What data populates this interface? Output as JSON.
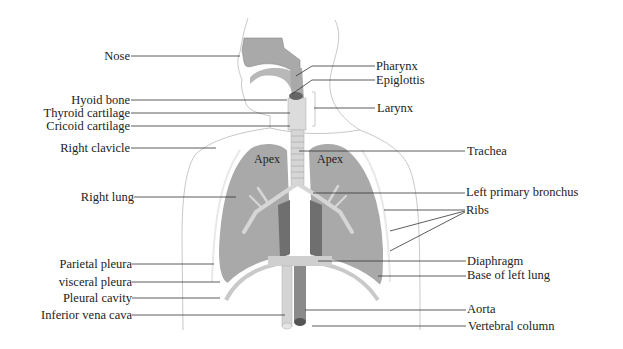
{
  "left_labels": [
    {
      "id": "nose",
      "text": "Nose",
      "y": 56
    },
    {
      "id": "hyoid-bone",
      "text": "Hyoid bone",
      "y": 100
    },
    {
      "id": "thyroid-cartilage",
      "text": "Thyroid cartilage",
      "y": 113
    },
    {
      "id": "cricoid-cartilage",
      "text": "Cricoid cartilage",
      "y": 126
    },
    {
      "id": "right-clavicle",
      "text": "Right clavicle",
      "y": 148
    },
    {
      "id": "right-lung",
      "text": "Right lung",
      "y": 197
    },
    {
      "id": "parietal-pleura",
      "text": "Parietal pleura",
      "y": 264
    },
    {
      "id": "visceral-pleura",
      "text": "visceral pleura",
      "y": 282
    },
    {
      "id": "pleural-cavity",
      "text": "Pleural cavity",
      "y": 298
    },
    {
      "id": "inferior-vena-cava",
      "text": "Inferior vena cava",
      "y": 315
    }
  ],
  "right_labels": [
    {
      "id": "pharynx",
      "text": "Pharynx",
      "y": 66
    },
    {
      "id": "epiglottis",
      "text": "Epiglottis",
      "y": 80
    },
    {
      "id": "larynx",
      "text": "Larynx",
      "y": 108
    },
    {
      "id": "trachea",
      "text": "Trachea",
      "y": 151
    },
    {
      "id": "left-primary-bronchus",
      "text": "Left primary bronchus",
      "y": 192
    },
    {
      "id": "ribs",
      "text": "Ribs",
      "y": 210
    },
    {
      "id": "diaphragm",
      "text": "Diaphragm",
      "y": 261
    },
    {
      "id": "base-of-left-lung",
      "text": "Base of left lung",
      "y": 275
    },
    {
      "id": "aorta",
      "text": "Aorta",
      "y": 309
    },
    {
      "id": "vertebral-column",
      "text": "Vertebral column",
      "y": 326
    }
  ],
  "apex_labels": {
    "left": "Apex",
    "right": "Apex"
  },
  "colors": {
    "lung": "#a9a9a9",
    "lung_dark": "#6f6f6f",
    "outline": "#bdbdbd",
    "airway": "#d6d6d6",
    "leader": "#333333"
  }
}
